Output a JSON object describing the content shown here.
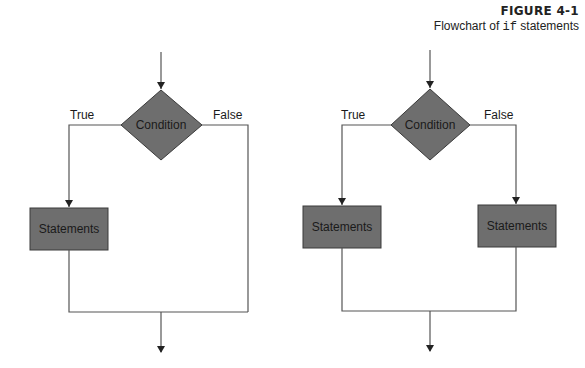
{
  "caption": {
    "figure_number": "FIGURE 4-1",
    "title_prefix": "Flowchart of ",
    "title_code": "if",
    "title_suffix": " statements"
  },
  "colors": {
    "shape_fill": "#6e6e6e",
    "shape_stroke": "#3a3a3a",
    "line": "#555555",
    "background": "#ffffff"
  },
  "left_flowchart": {
    "decision_label": "Condition",
    "true_label": "True",
    "false_label": "False",
    "true_statements_label": "Statements"
  },
  "right_flowchart": {
    "decision_label": "Condition",
    "true_label": "True",
    "false_label": "False",
    "true_statements_label": "Statements",
    "false_statements_label": "Statements"
  }
}
